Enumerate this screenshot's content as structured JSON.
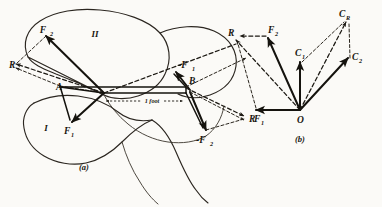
{
  "figure": {
    "captions": {
      "a": "(a)",
      "b": "(b)"
    },
    "dimension": {
      "label": "1 foot"
    },
    "regions": {
      "body_one": "I",
      "body_two": "II"
    },
    "diagram_a": {
      "points": {
        "A": "A",
        "B": "B"
      },
      "vectors": [
        {
          "name": "F2",
          "base": "F",
          "sub": "2",
          "style": "solid"
        },
        {
          "name": "F1",
          "base": "F",
          "sub": "1",
          "style": "solid"
        },
        {
          "name": "R-upper",
          "base": "R",
          "sub": "",
          "style": "dashed"
        },
        {
          "name": "R-lower",
          "base": "R",
          "sub": "",
          "style": "dashed"
        },
        {
          "name": "-F1",
          "base": "-F",
          "sub": "1",
          "style": "solid"
        },
        {
          "name": "-F2",
          "base": "-F",
          "sub": "2",
          "style": "solid"
        }
      ],
      "labels": {
        "F2": "F",
        "F2_sub": "2",
        "F1": "F",
        "F1_sub": "1",
        "R_upper": "R",
        "R_lower": "R",
        "negF1": "-F",
        "negF1_sub": "1",
        "negF2": "-F",
        "negF2_sub": "2",
        "A": "A",
        "B": "B"
      }
    },
    "diagram_b": {
      "origin": "O",
      "labels": {
        "R": "R",
        "F2": "F",
        "F2_sub": "2",
        "F1": "F",
        "F1_sub": "1",
        "CR": "C",
        "CR_sub": "R",
        "C1": "C",
        "C1_sub": "1",
        "C2": "C",
        "C2_sub": "2"
      },
      "vectors": [
        {
          "name": "F1",
          "style": "solid"
        },
        {
          "name": "F2",
          "style": "solid"
        },
        {
          "name": "R",
          "style": "dashed"
        },
        {
          "name": "C1",
          "style": "solid"
        },
        {
          "name": "C2",
          "style": "solid"
        },
        {
          "name": "CR",
          "style": "dashed"
        }
      ]
    },
    "colors": {
      "ink": "#15130e",
      "paper": "#fbfaf7",
      "outline": "#2b2620"
    }
  }
}
